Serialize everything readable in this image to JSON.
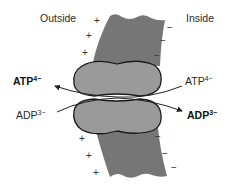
{
  "labels": {
    "outside": "Outside",
    "inside": "Inside"
  },
  "molecules": {
    "atp_outside": {
      "base": "ATP",
      "charge": "4−",
      "weight": "bold"
    },
    "atp_inside": {
      "base": "ATP",
      "charge": "4−",
      "weight": "normal"
    },
    "adp_outside": {
      "base": "ADP",
      "charge": "3−",
      "weight": "normal"
    },
    "adp_inside": {
      "base": "ADP",
      "charge": "3−",
      "weight": "bold"
    }
  },
  "charges": {
    "outside_symbol": "+",
    "inside_symbol": "−",
    "outside_count": 6,
    "inside_count": 6
  },
  "colors": {
    "membrane": "#767676",
    "protein_fill": "#9a9a9a",
    "protein_stroke": "#1a1a1a",
    "arrow": "#222222",
    "text": "#2a2a2a"
  },
  "flows": [
    {
      "from": "inside",
      "to": "outside",
      "molecule": "ATP4-"
    },
    {
      "from": "outside",
      "to": "inside",
      "molecule": "ADP3-"
    }
  ]
}
